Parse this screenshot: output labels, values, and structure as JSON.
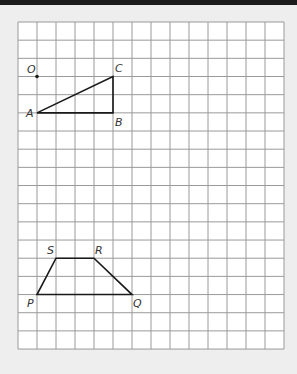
{
  "grid": {
    "left": 18,
    "top": 22,
    "cols": 14,
    "rows": 18,
    "cell_w": 19,
    "cell_h": 18.17,
    "line_color": "#9a9a9a",
    "fill": "#ffffff"
  },
  "colors": {
    "background": "#eeeeee",
    "topbar": "#1c1c1c",
    "shape": "#1a1a1a"
  },
  "points": [
    {
      "name": "O",
      "col": 1,
      "row": 3,
      "dot": true,
      "label_dx": -10,
      "label_dy": -4
    },
    {
      "name": "A",
      "col": 1,
      "row": 5,
      "label_dx": -11,
      "label_dy": 4
    },
    {
      "name": "B",
      "col": 5,
      "row": 5,
      "label_dx": 2,
      "label_dy": 13
    },
    {
      "name": "C",
      "col": 5,
      "row": 3,
      "label_dx": 2,
      "label_dy": -5
    },
    {
      "name": "S",
      "col": 2,
      "row": 13,
      "label_dx": -9,
      "label_dy": -4
    },
    {
      "name": "R",
      "col": 4,
      "row": 13,
      "label_dx": 1,
      "label_dy": -4
    },
    {
      "name": "P",
      "col": 1,
      "row": 15,
      "label_dx": -10,
      "label_dy": 12
    },
    {
      "name": "Q",
      "col": 6,
      "row": 15,
      "label_dx": 1,
      "label_dy": 12
    }
  ],
  "polygons": [
    {
      "name": "triangle-ABC",
      "vertices": [
        "A",
        "B",
        "C"
      ]
    },
    {
      "name": "trapezoid-PQRS",
      "vertices": [
        "P",
        "Q",
        "R",
        "S"
      ]
    }
  ]
}
